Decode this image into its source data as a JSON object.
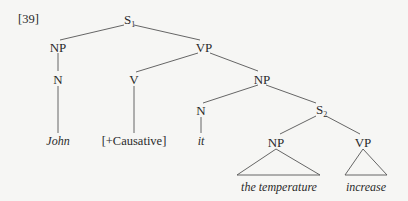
{
  "example_number": "[39]",
  "tree": {
    "root": {
      "label": "S",
      "subscript": "1"
    },
    "nodes": {
      "np_subject": "NP",
      "n_subject": "N",
      "vp_main": "VP",
      "v_main": "V",
      "np_object": "NP",
      "n_object": "N",
      "s_embedded": {
        "label": "S",
        "subscript": "2"
      },
      "np_embedded": "NP",
      "vp_embedded": "VP"
    },
    "leaves": {
      "john": "John",
      "causative": "[+Causative]",
      "it": "it",
      "the_temperature": "the temperature",
      "increase": "increase"
    }
  }
}
